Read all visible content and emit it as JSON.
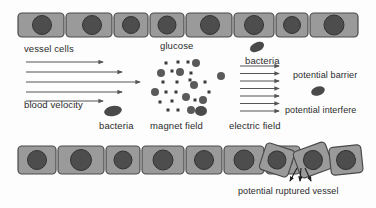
{
  "figure": {
    "background": "#fdfdfd"
  },
  "colors": {
    "cell_body": "#9a9a9a",
    "cell_outline": "#4a4a4a",
    "nucleus": "#4d4d4d",
    "nucleus_outline": "#333333",
    "arrow": "#555555",
    "particle": "#5a5a5a",
    "bacteria": "#4a4a4a",
    "text": "#2b2b2b"
  },
  "labels": {
    "vessel_cells": "vessel cells",
    "glucose": "glucose",
    "bacteria_top": "bacteria",
    "potential_barrier": "potential barrier",
    "blood_velocity": "blood velocity",
    "bacteria_bottom": "bacteria",
    "magnet_field": "magnet field",
    "electric_field": "electric field",
    "potential_interfere": "potential interfere",
    "potential_ruptured_vessel": "potential ruptured vessel"
  },
  "top_vessel_row": {
    "count": 8,
    "cells": [
      {
        "x": 18,
        "w": 46,
        "nucleus_cx": 42,
        "nucleus_r": 9.5
      },
      {
        "x": 66,
        "w": 46,
        "nucleus_cx": 92,
        "nucleus_r": 9.5
      },
      {
        "x": 114,
        "w": 34,
        "nucleus_cx": 131,
        "nucleus_r": 8.5
      },
      {
        "x": 150,
        "w": 34,
        "nucleus_cx": 167,
        "nucleus_r": 9.0
      },
      {
        "x": 186,
        "w": 46,
        "nucleus_cx": 210,
        "nucleus_r": 9.5
      },
      {
        "x": 234,
        "w": 40,
        "nucleus_cx": 254,
        "nucleus_r": 9.5
      },
      {
        "x": 276,
        "w": 32,
        "nucleus_cx": 292,
        "nucleus_r": 8.5
      },
      {
        "x": 310,
        "w": 48,
        "nucleus_cx": 334,
        "nucleus_r": 10.0
      }
    ],
    "y": 13,
    "h": 24
  },
  "bottom_vessel_row": {
    "count": 10,
    "y": 146,
    "h": 28,
    "cells": [
      {
        "x": 18,
        "w": 38,
        "rot": 0,
        "nucleus_r": 9.5
      },
      {
        "x": 58,
        "w": 46,
        "rot": 0,
        "nucleus_r": 10.5
      },
      {
        "x": 106,
        "w": 34,
        "rot": 0,
        "nucleus_r": 9.0
      },
      {
        "x": 142,
        "w": 42,
        "rot": 0,
        "nucleus_r": 10.0
      },
      {
        "x": 186,
        "w": 36,
        "rot": 0,
        "nucleus_r": 9.5
      },
      {
        "x": 224,
        "w": 40,
        "rot": 0,
        "nucleus_r": 10.0
      },
      {
        "x": 266,
        "w": 34,
        "rot": 0,
        "nucleus_r": 9.5
      },
      {
        "x": 262,
        "w": 30,
        "rot": 18,
        "nucleus_r": 9.0
      },
      {
        "x": 296,
        "w": 34,
        "rot": -20,
        "nucleus_r": 9.5
      },
      {
        "x": 330,
        "w": 32,
        "rot": -6,
        "nucleus_r": 9.5
      }
    ],
    "rupture_gap_x": 292
  },
  "blood_velocity_arrows": {
    "count": 5,
    "x_start": 26,
    "arrows": [
      {
        "y": 62,
        "x2": 103
      },
      {
        "y": 72,
        "x2": 122
      },
      {
        "y": 82,
        "x2": 140
      },
      {
        "y": 92,
        "x2": 122
      },
      {
        "y": 101,
        "x2": 103
      }
    ]
  },
  "electric_field_arrows": {
    "count": 7,
    "x_start": 240,
    "x_end": 279,
    "y_start": 66,
    "y_step": 7.5
  },
  "glucose_particles": {
    "description": "large filled circles representing glucose",
    "radius": 4.0,
    "points": [
      {
        "x": 196,
        "y": 63
      },
      {
        "x": 161,
        "y": 73
      },
      {
        "x": 180,
        "y": 72
      },
      {
        "x": 221,
        "y": 76
      },
      {
        "x": 194,
        "y": 85
      },
      {
        "x": 155,
        "y": 92
      },
      {
        "x": 186,
        "y": 97
      },
      {
        "x": 203,
        "y": 100
      },
      {
        "x": 191,
        "y": 110
      }
    ]
  },
  "magnet_field_particles": {
    "description": "small filled squares representing magnetic field particles",
    "size": 3.0,
    "points": [
      {
        "x": 166,
        "y": 63
      },
      {
        "x": 178,
        "y": 62
      },
      {
        "x": 188,
        "y": 62
      },
      {
        "x": 172,
        "y": 71
      },
      {
        "x": 191,
        "y": 73
      },
      {
        "x": 163,
        "y": 82
      },
      {
        "x": 177,
        "y": 82
      },
      {
        "x": 190,
        "y": 80
      },
      {
        "x": 205,
        "y": 82
      },
      {
        "x": 166,
        "y": 92
      },
      {
        "x": 176,
        "y": 92
      },
      {
        "x": 209,
        "y": 92
      },
      {
        "x": 160,
        "y": 102
      },
      {
        "x": 172,
        "y": 101
      },
      {
        "x": 195,
        "y": 100
      },
      {
        "x": 168,
        "y": 110
      },
      {
        "x": 178,
        "y": 110
      }
    ]
  },
  "bacteria_blobs": [
    {
      "name": "bacteria-top",
      "cx": 257,
      "cy": 47,
      "rx": 7.5,
      "ry": 4.5,
      "rot": -25
    },
    {
      "name": "bacteria-potential-barrier",
      "cx": 318,
      "cy": 91,
      "rx": 7.0,
      "ry": 4.5,
      "rot": -18
    },
    {
      "name": "bacteria-bottom-left",
      "cx": 113,
      "cy": 111,
      "rx": 9.0,
      "ry": 5.0,
      "rot": -12
    },
    {
      "name": "bacteria-magnet-field",
      "cx": 201,
      "cy": 111,
      "rx": 6.0,
      "ry": 5.0,
      "rot": 0
    }
  ],
  "rupture_arrows": {
    "count": 3,
    "tip_y": 182,
    "origin_y": 168,
    "tips": [
      {
        "x1": 297,
        "y1": 168,
        "x2": 290,
        "y2": 181
      },
      {
        "x1": 301,
        "y1": 168,
        "x2": 300,
        "y2": 181
      },
      {
        "x1": 305,
        "y1": 168,
        "x2": 311,
        "y2": 181
      }
    ]
  }
}
